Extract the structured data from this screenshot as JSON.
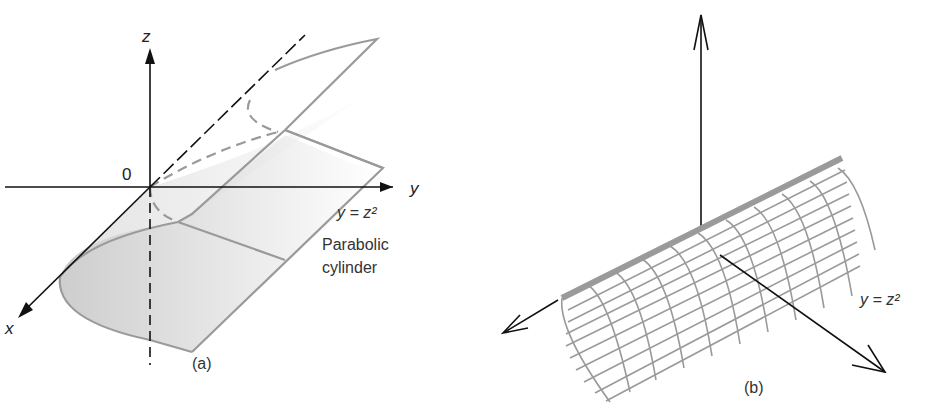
{
  "panel_a": {
    "caption": "(a)",
    "axis_x": "x",
    "axis_y": "y",
    "axis_z": "z",
    "origin": "0",
    "equation": "y = z²",
    "surface_name_line1": "Parabolic",
    "surface_name_line2": "cylinder"
  },
  "panel_b": {
    "caption": "(b)",
    "equation": "y = z²"
  },
  "colors": {
    "axis": "#111111",
    "surface_edge": "#9a9a9a",
    "mesh": "#9a9a9a",
    "shade": "#c8c8c8"
  }
}
